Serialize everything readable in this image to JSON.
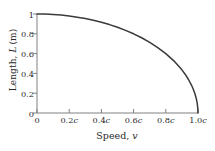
{
  "chart_data": {
    "type": "line",
    "title": "",
    "subtitle": "",
    "xlabel_text": "Speed, ",
    "xlabel_symbol": "v",
    "ylabel": "Length, L (m)",
    "xlim": [
      0,
      1
    ],
    "ylim": [
      0,
      1
    ],
    "grid": false,
    "legend": "none",
    "x_tick_labels": [
      "0",
      "0.2c",
      "0.4c",
      "0.6c",
      "0.8c",
      "1.0c"
    ],
    "x_tick_values": [
      0,
      0.2,
      0.4,
      0.6,
      0.8,
      1.0
    ],
    "y_tick_labels": [
      "0",
      "0.2",
      "0.4",
      "0.6",
      "0.8",
      "1"
    ],
    "y_tick_values": [
      0,
      0.2,
      0.4,
      0.6,
      0.8,
      1.0
    ],
    "series": [
      {
        "name": "length contraction",
        "color": "#3a3a3a",
        "x": [
          0.0,
          0.05,
          0.1,
          0.15,
          0.2,
          0.25,
          0.3,
          0.35,
          0.4,
          0.45,
          0.5,
          0.55,
          0.6,
          0.65,
          0.7,
          0.75,
          0.8,
          0.85,
          0.9,
          0.92,
          0.94,
          0.96,
          0.97,
          0.98,
          0.99,
          0.995,
          0.999,
          1.0
        ],
        "values": [
          1.0,
          0.999,
          0.995,
          0.989,
          0.98,
          0.968,
          0.954,
          0.937,
          0.917,
          0.893,
          0.866,
          0.835,
          0.8,
          0.76,
          0.714,
          0.661,
          0.6,
          0.527,
          0.436,
          0.392,
          0.341,
          0.28,
          0.243,
          0.199,
          0.141,
          0.1,
          0.045,
          0.0
        ]
      }
    ]
  },
  "axes": {
    "line_color": "#808080",
    "tick_color": "#808080",
    "text_color": "#2a2a2a",
    "background": "#ffffff"
  }
}
